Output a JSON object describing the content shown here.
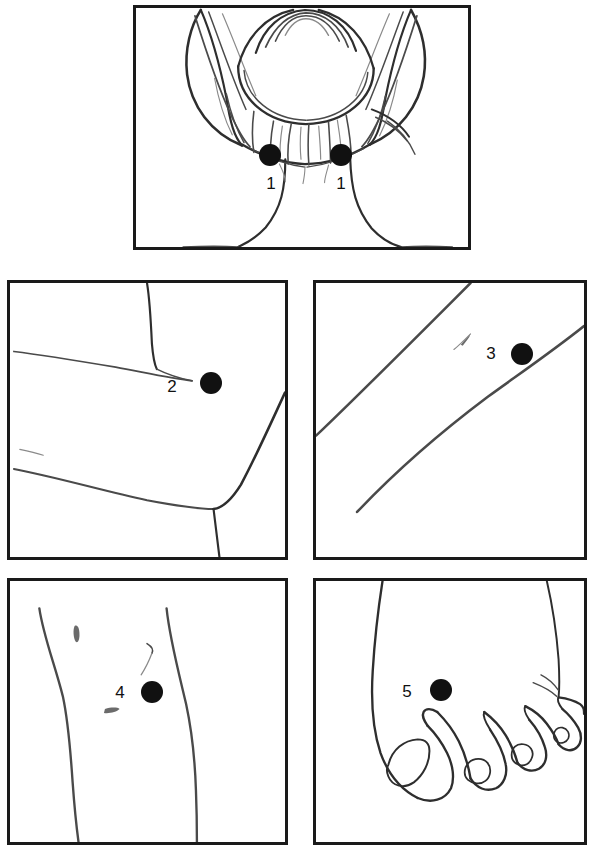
{
  "figure": {
    "background_color": "#ffffff",
    "border_color": "#1a1a1a",
    "marker_color": "#111111",
    "line_color": "#4a4a4a",
    "width": 600,
    "height": 854
  },
  "panels": [
    {
      "id": "panel-1",
      "region": "back-of-head-and-neck",
      "description": "Rear view of head with hair gathered in a bun, neck and shoulders",
      "x": 133,
      "y": 5,
      "width": 338,
      "height": 245,
      "markers": [
        {
          "label": "1",
          "dot_x": 270,
          "dot_y": 155,
          "dot_d": 22,
          "label_x": 271,
          "label_y": 183
        },
        {
          "label": "1",
          "dot_x": 341,
          "dot_y": 155,
          "dot_d": 22,
          "label_x": 341,
          "label_y": 183
        }
      ]
    },
    {
      "id": "panel-2",
      "region": "elbow",
      "description": "Bent arm showing upper arm, elbow crease and forearm",
      "x": 7,
      "y": 280,
      "width": 281,
      "height": 280,
      "markers": [
        {
          "label": "2",
          "dot_x": 211,
          "dot_y": 383,
          "dot_d": 22,
          "label_x": 172,
          "label_y": 386
        }
      ]
    },
    {
      "id": "panel-3",
      "region": "forearm-wrist",
      "description": "Diagonal view of forearm with two contour lines and a small skin mark",
      "x": 313,
      "y": 280,
      "width": 274,
      "height": 280,
      "markers": [
        {
          "label": "3",
          "dot_x": 522,
          "dot_y": 354,
          "dot_d": 22,
          "label_x": 491,
          "label_y": 353
        }
      ]
    },
    {
      "id": "panel-4",
      "region": "knee-leg",
      "description": "Front view of lower leg and knee with small skin marks",
      "x": 7,
      "y": 578,
      "width": 281,
      "height": 267,
      "markers": [
        {
          "label": "4",
          "dot_x": 152,
          "dot_y": 692,
          "dot_d": 22,
          "label_x": 120,
          "label_y": 692
        }
      ]
    },
    {
      "id": "panel-5",
      "region": "foot-toes",
      "description": "Top view of a foot showing the big toe with square nail and four smaller toes",
      "x": 313,
      "y": 578,
      "width": 274,
      "height": 267,
      "markers": [
        {
          "label": "5",
          "dot_x": 441,
          "dot_y": 690,
          "dot_d": 22,
          "label_x": 407,
          "label_y": 691
        }
      ]
    }
  ]
}
